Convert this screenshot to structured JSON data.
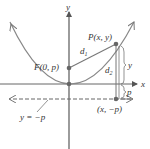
{
  "diagram": {
    "type": "parabola-focus-directrix",
    "labels": {
      "y_axis": "y",
      "x_axis": "x",
      "focus": "F(0, p)",
      "point": "P(x, y)",
      "d1": "d",
      "d1_sub": "1",
      "d2": "d",
      "d2_sub": "2",
      "y_segment": "y",
      "p_segment": "p",
      "foot_point": "(x, −p)",
      "directrix": "y = −p"
    },
    "colors": {
      "curve": "#777777",
      "axis": "#555555",
      "point": "#555555",
      "text": "#333333",
      "directrix": "#666666"
    }
  }
}
